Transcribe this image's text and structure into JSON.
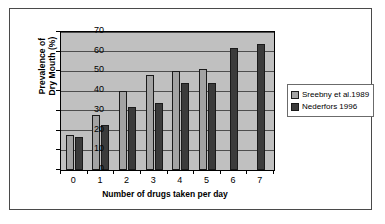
{
  "chart_data": {
    "type": "bar",
    "title": "",
    "xlabel": "Number of drugs taken per day",
    "ylabel_line1": "Prevalence of",
    "ylabel_line2": "Dry Mouth (%)",
    "categories": [
      "0",
      "1",
      "2",
      "3",
      "4",
      "5",
      "6",
      "7"
    ],
    "yticks": [
      "0",
      "10",
      "20",
      "30",
      "40",
      "50",
      "60",
      "70"
    ],
    "ylim": [
      0,
      70
    ],
    "grid": true,
    "legend_position": "right",
    "series": [
      {
        "name": "Sreebny et al.1989",
        "color": "#a3a3a3",
        "values": [
          18,
          28,
          40,
          48,
          50,
          51,
          null,
          null
        ]
      },
      {
        "name": "Nederfors  1996",
        "color": "#3b3b3b",
        "values": [
          17,
          23,
          32,
          34,
          44,
          44,
          62,
          64
        ]
      }
    ]
  },
  "figure": {
    "plot_background": "#c0c0c0",
    "frame_color": "#4a4a4a"
  }
}
